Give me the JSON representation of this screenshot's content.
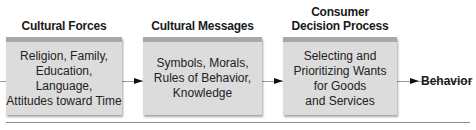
{
  "diagram": {
    "stages": [
      {
        "heading": [
          "Cultural Forces"
        ],
        "content": [
          "Religion, Family,",
          "Education, Language,",
          "Attitudes toward Time"
        ]
      },
      {
        "heading": [
          "Cultural Messages"
        ],
        "content": [
          "Symbols, Morals,",
          "Rules of Behavior,",
          "Knowledge"
        ]
      },
      {
        "heading": [
          "Consumer",
          "Decision Process"
        ],
        "content": [
          "Selecting and",
          "Prioritizing Wants",
          "for Goods",
          "and Services"
        ]
      }
    ],
    "outcome": "Behavior",
    "colors": {
      "box_fill": "#dcdcdc",
      "box_top_band": "#a8a8a8",
      "arrow": "#111111",
      "line": "#9a9a9a"
    }
  }
}
